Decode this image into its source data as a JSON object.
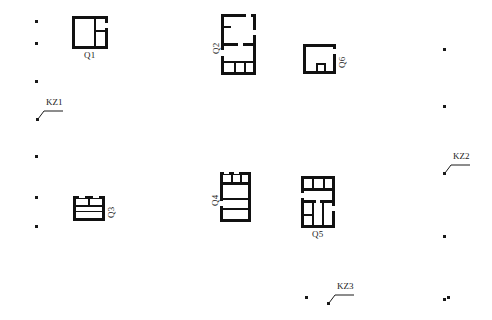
{
  "plan": {
    "width": 492,
    "height": 320,
    "background_color": "#ffffff",
    "ink_color": "#1a1a1a",
    "wall_fill": "#111111",
    "type": "archaeological-site-plan"
  },
  "structures": [
    {
      "id": "Q1",
      "label": "Q1",
      "label_orientation": "horizontal",
      "label_position": "below",
      "x": 72,
      "y": 16,
      "width": 36,
      "height": 33,
      "description": "square room with vertical partition and right cell split horizontally"
    },
    {
      "id": "Q2",
      "label": "Q2",
      "label_orientation": "vertical",
      "label_position": "left",
      "x": 221,
      "y": 14,
      "width": 35,
      "height": 61,
      "description": "two-room rectangular block, lower room subdivided into three small cells"
    },
    {
      "id": "Q6",
      "label": "Q6",
      "label_orientation": "vertical",
      "label_position": "right",
      "x": 303,
      "y": 44,
      "width": 33,
      "height": 30,
      "description": "single square room with small square feature at base"
    },
    {
      "id": "Q3",
      "label": "Q3",
      "label_orientation": "vertical",
      "label_position": "right",
      "x": 73,
      "y": 196,
      "width": 32,
      "height": 25,
      "description": "room with two small cells along the north wall"
    },
    {
      "id": "Q4",
      "label": "Q4",
      "label_orientation": "vertical",
      "label_position": "left",
      "x": 220,
      "y": 172,
      "width": 31,
      "height": 50,
      "description": "narrow block with two north cells and horizontal room divisions"
    },
    {
      "id": "Q5",
      "label": "Q5",
      "label_orientation": "horizontal",
      "label_position": "below",
      "x": 301,
      "y": 176,
      "width": 34,
      "height": 52,
      "description": "multi-room block with north cells and three southern chambers"
    }
  ],
  "annotations": [
    {
      "id": "KZ1",
      "label": "KZ1",
      "x": 34,
      "y": 98
    },
    {
      "id": "KZ2",
      "label": "KZ2",
      "x": 441,
      "y": 152
    },
    {
      "id": "KZ3",
      "label": "KZ3",
      "x": 325,
      "y": 282
    }
  ],
  "grid_points": [
    {
      "x": 35,
      "y": 20
    },
    {
      "x": 35,
      "y": 42
    },
    {
      "x": 35,
      "y": 80
    },
    {
      "x": 35,
      "y": 155
    },
    {
      "x": 35,
      "y": 196
    },
    {
      "x": 35,
      "y": 225
    },
    {
      "x": 443,
      "y": 48
    },
    {
      "x": 443,
      "y": 105
    },
    {
      "x": 443,
      "y": 235
    },
    {
      "x": 443,
      "y": 298
    },
    {
      "x": 305,
      "y": 296
    },
    {
      "x": 447,
      "y": 296
    }
  ]
}
